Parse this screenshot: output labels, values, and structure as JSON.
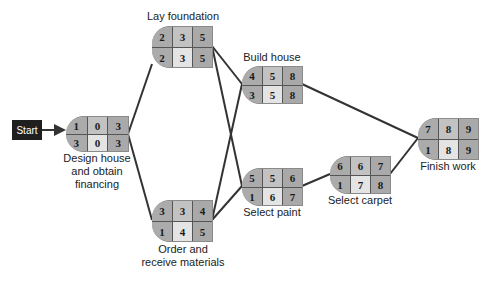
{
  "diagram": {
    "type": "activity-on-node network",
    "start_label": "Start",
    "node_legend": {
      "top_row": [
        "activity number",
        "earliest start",
        "earliest finish"
      ],
      "bottom_row": [
        "duration",
        "latest start",
        "latest finish"
      ]
    },
    "nodes": [
      {
        "id": "design",
        "label": "Design house\nand obtain\nfinancing",
        "top": [
          "1",
          "0",
          "3"
        ],
        "bottom": [
          "3",
          "0",
          "3"
        ]
      },
      {
        "id": "foundation",
        "label": "Lay foundation",
        "top": [
          "2",
          "3",
          "5"
        ],
        "bottom": [
          "2",
          "3",
          "5"
        ]
      },
      {
        "id": "order",
        "label": "Order and\nreceive materials",
        "top": [
          "3",
          "3",
          "4"
        ],
        "bottom": [
          "1",
          "4",
          "5"
        ]
      },
      {
        "id": "build",
        "label": "Build house",
        "top": [
          "4",
          "5",
          "8"
        ],
        "bottom": [
          "3",
          "5",
          "8"
        ]
      },
      {
        "id": "paint",
        "label": "Select paint",
        "top": [
          "5",
          "5",
          "6"
        ],
        "bottom": [
          "1",
          "6",
          "7"
        ]
      },
      {
        "id": "carpet",
        "label": "Select carpet",
        "top": [
          "6",
          "6",
          "7"
        ],
        "bottom": [
          "1",
          "7",
          "8"
        ]
      },
      {
        "id": "finish",
        "label": "Finish work",
        "top": [
          "7",
          "8",
          "9"
        ],
        "bottom": [
          "1",
          "8",
          "9"
        ]
      }
    ],
    "edges": [
      [
        "start",
        "design"
      ],
      [
        "design",
        "foundation"
      ],
      [
        "design",
        "order"
      ],
      [
        "foundation",
        "build"
      ],
      [
        "foundation",
        "paint"
      ],
      [
        "order",
        "build"
      ],
      [
        "order",
        "paint"
      ],
      [
        "build",
        "finish"
      ],
      [
        "paint",
        "carpet"
      ],
      [
        "carpet",
        "finish"
      ]
    ]
  }
}
